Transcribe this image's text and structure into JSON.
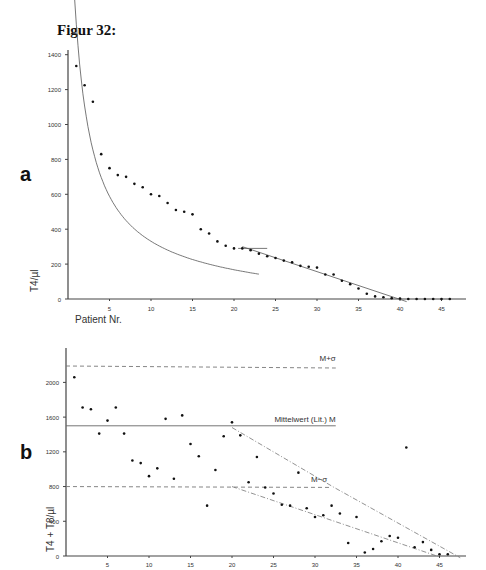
{
  "figure": {
    "title": "Figur 32:"
  },
  "panels": {
    "a": "a",
    "b": "b"
  },
  "chart_data": [
    {
      "panel": "a",
      "type": "scatter",
      "title": "",
      "xlabel": "Patient Nr.",
      "ylabel": "T4/µl",
      "xlim": [
        0,
        47
      ],
      "ylim": [
        0,
        1400
      ],
      "xticks": [
        5,
        10,
        15,
        20,
        25,
        30,
        35,
        40,
        45
      ],
      "yticks": [
        0,
        200,
        400,
        600,
        800,
        1000,
        1200,
        1400
      ],
      "grid": false,
      "x": [
        1,
        2,
        3,
        4,
        5,
        6,
        7,
        8,
        9,
        10,
        11,
        12,
        13,
        14,
        15,
        16,
        17,
        18,
        19,
        20,
        21,
        22,
        23,
        24,
        25,
        26,
        27,
        28,
        29,
        30,
        31,
        32,
        33,
        34,
        35,
        36,
        37,
        38,
        39,
        40,
        41,
        42,
        43,
        44,
        45,
        46
      ],
      "values": [
        1335,
        1225,
        1130,
        830,
        750,
        710,
        700,
        660,
        640,
        600,
        590,
        550,
        510,
        500,
        485,
        400,
        375,
        330,
        305,
        290,
        290,
        280,
        260,
        245,
        235,
        220,
        210,
        190,
        185,
        180,
        140,
        140,
        105,
        85,
        60,
        30,
        15,
        10,
        5,
        3,
        0,
        0,
        0,
        0,
        0,
        0
      ],
      "fits": [
        {
          "name": "hyperbolic fit",
          "style": "solid",
          "x_range": [
            0.6,
            23
          ]
        },
        {
          "name": "linear fit",
          "style": "solid",
          "x_range": [
            21,
            41
          ]
        }
      ]
    },
    {
      "panel": "b",
      "type": "scatter",
      "title": "",
      "xlabel": "",
      "ylabel": "T4 + T8/µl",
      "xlim": [
        0,
        47
      ],
      "ylim": [
        0,
        2400
      ],
      "xticks": [
        5,
        10,
        15,
        20,
        25,
        30,
        35,
        40,
        45
      ],
      "yticks": [
        0,
        400,
        800,
        1200,
        1600,
        2000
      ],
      "grid": false,
      "x": [
        1,
        2,
        3,
        4,
        5,
        6,
        7,
        8,
        9,
        10,
        11,
        12,
        13,
        14,
        15,
        16,
        17,
        18,
        19,
        20,
        21,
        22,
        23,
        24,
        25,
        26,
        27,
        28,
        29,
        30,
        31,
        32,
        33,
        34,
        35,
        36,
        37,
        38,
        39,
        40,
        41,
        42,
        43,
        44,
        45,
        46
      ],
      "values": [
        2060,
        1710,
        1690,
        1410,
        1560,
        1710,
        1410,
        1100,
        1070,
        920,
        1010,
        1580,
        890,
        1620,
        1290,
        1150,
        580,
        990,
        1380,
        1540,
        1390,
        850,
        1140,
        790,
        720,
        590,
        580,
        960,
        550,
        450,
        470,
        580,
        490,
        150,
        450,
        40,
        80,
        170,
        230,
        210,
        1250,
        100,
        160,
        70,
        20,
        20
      ],
      "reference_lines": [
        {
          "label": "M+σ",
          "value": 2200,
          "style": "dashed"
        },
        {
          "label": "Mittelwert (Lit.) M",
          "value": 1500,
          "style": "solid"
        },
        {
          "label": "M−σ",
          "value": 800,
          "style": "dashed"
        }
      ],
      "trend_lines": [
        {
          "name": "upper bound",
          "style": "dash-dot",
          "from": [
            20,
            1500
          ],
          "to": [
            47,
            0
          ]
        },
        {
          "name": "lower bound",
          "style": "dash-dot",
          "from": [
            20,
            800
          ],
          "to": [
            45,
            0
          ]
        }
      ]
    }
  ],
  "labels": {
    "a_xlabel": "Patient Nr.",
    "a_ylabel": "T4/µl",
    "b_ylabel": "T4 + T8/µl",
    "m_plus_sigma": "M+σ",
    "mittelwert": "Mittelwert (Lit.) M",
    "m_minus_sigma": "M−σ"
  }
}
